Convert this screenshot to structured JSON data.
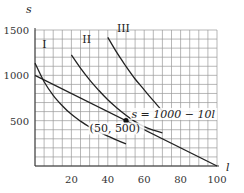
{
  "chart_data": {
    "type": "line",
    "title": "",
    "xlabel": "l",
    "ylabel": "s",
    "xlim": [
      0,
      100
    ],
    "ylim": [
      0,
      1500
    ],
    "grid": true,
    "grid_step_x": 5,
    "grid_step_y": 100,
    "x_ticks": [
      20,
      40,
      60,
      80,
      100
    ],
    "y_ticks": [
      500,
      1000,
      1500
    ],
    "series": [
      {
        "name": "I",
        "type": "curve",
        "points": [
          [
            0,
            1135
          ],
          [
            5,
            930
          ],
          [
            10,
            780
          ],
          [
            15,
            665
          ],
          [
            20,
            570
          ],
          [
            25,
            495
          ],
          [
            30,
            430
          ],
          [
            35,
            375
          ],
          [
            40,
            330
          ],
          [
            45,
            285
          ],
          [
            50,
            245
          ]
        ]
      },
      {
        "name": "II",
        "type": "curve",
        "points": [
          [
            20,
            1225
          ],
          [
            25,
            1080
          ],
          [
            30,
            950
          ],
          [
            35,
            835
          ],
          [
            40,
            730
          ],
          [
            45,
            640
          ],
          [
            50,
            560
          ],
          [
            55,
            490
          ],
          [
            60,
            435
          ],
          [
            65,
            395
          ],
          [
            70,
            365
          ]
        ]
      },
      {
        "name": "III",
        "type": "curve",
        "points": [
          [
            40,
            1420
          ],
          [
            45,
            1250
          ],
          [
            50,
            1100
          ],
          [
            55,
            960
          ],
          [
            60,
            840
          ],
          [
            65,
            720
          ],
          [
            70,
            605
          ]
        ]
      },
      {
        "name": "s = 1000 - 10l",
        "type": "line",
        "points": [
          [
            0,
            1000
          ],
          [
            100,
            0
          ]
        ]
      }
    ],
    "annotations": [
      {
        "text": "I",
        "x": 4,
        "y": 1300
      },
      {
        "text": "II",
        "x": 26,
        "y": 1355
      },
      {
        "text": "III",
        "x": 45,
        "y": 1475
      },
      {
        "text": "s = 1000 − 10l",
        "x": 53,
        "y": 530
      },
      {
        "text": "(50, 500)",
        "x": 30,
        "y": 370
      }
    ],
    "highlight_point": {
      "x": 50,
      "y": 500,
      "label": "(50, 500)"
    }
  }
}
